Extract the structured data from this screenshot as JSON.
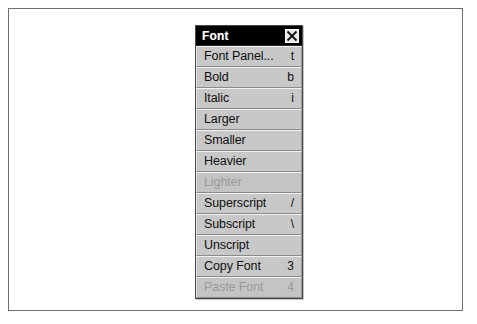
{
  "window": {
    "title": "Font",
    "close_icon": "close-x-icon",
    "accent_titlebar_bg": "#000000",
    "accent_titlebar_fg": "#ffffff",
    "panel_bg": "#c6c6c6",
    "frame_border": "#6e6e70"
  },
  "menu": {
    "items": [
      {
        "label": "Font Panel...",
        "shortcut": "t",
        "enabled": true
      },
      {
        "label": "Bold",
        "shortcut": "b",
        "enabled": true
      },
      {
        "label": "Italic",
        "shortcut": "i",
        "enabled": true
      },
      {
        "label": "Larger",
        "shortcut": "",
        "enabled": true
      },
      {
        "label": "Smaller",
        "shortcut": "",
        "enabled": true
      },
      {
        "label": "Heavier",
        "shortcut": "",
        "enabled": true
      },
      {
        "label": "Lighter",
        "shortcut": "",
        "enabled": false
      },
      {
        "label": "Superscript",
        "shortcut": "/",
        "enabled": true
      },
      {
        "label": "Subscript",
        "shortcut": "\\",
        "enabled": true
      },
      {
        "label": "Unscript",
        "shortcut": "",
        "enabled": true
      },
      {
        "label": "Copy Font",
        "shortcut": "3",
        "enabled": true
      },
      {
        "label": "Paste Font",
        "shortcut": "4",
        "enabled": false
      }
    ]
  },
  "page": {
    "footer_smudge": ""
  }
}
